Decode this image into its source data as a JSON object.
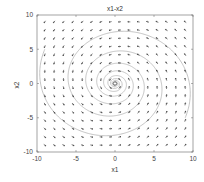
{
  "chart_data": {
    "type": "quiver",
    "title": "x1-x2",
    "xlabel": "x1",
    "ylabel": "x2",
    "xlim": [
      -10,
      10
    ],
    "ylim": [
      -10,
      10
    ],
    "xticks": [
      -10,
      -5,
      0,
      5,
      10
    ],
    "yticks": [
      -10,
      -5,
      0,
      5,
      10
    ],
    "xtick_labels": [
      "-10",
      "-5",
      "0",
      "5",
      "10"
    ],
    "ytick_labels": [
      "-10",
      "-5",
      "0",
      "5",
      "10"
    ],
    "grid": false,
    "legend": null,
    "vector_field": {
      "description": "Phase portrait, counter-clockwise stable spiral toward origin",
      "grid_range": [
        -9,
        9
      ],
      "grid_count": 16,
      "equations": "dx1/dt = -x2 - 0.15*x1, dx2/dt = x1 - 0.15*x2",
      "a": -0.15,
      "b": -1,
      "c": 1,
      "d": -0.15,
      "arrow_color": "#222222"
    },
    "trajectories": [
      {
        "name": "spiral",
        "start": [
          9,
          -5
        ],
        "color": "#aaaaaa"
      },
      {
        "name": "spiral2",
        "start": [
          -9,
          5
        ],
        "color": "#aaaaaa"
      }
    ],
    "equilibrium": {
      "x1": 0,
      "x2": 0,
      "marker": "circle"
    }
  }
}
